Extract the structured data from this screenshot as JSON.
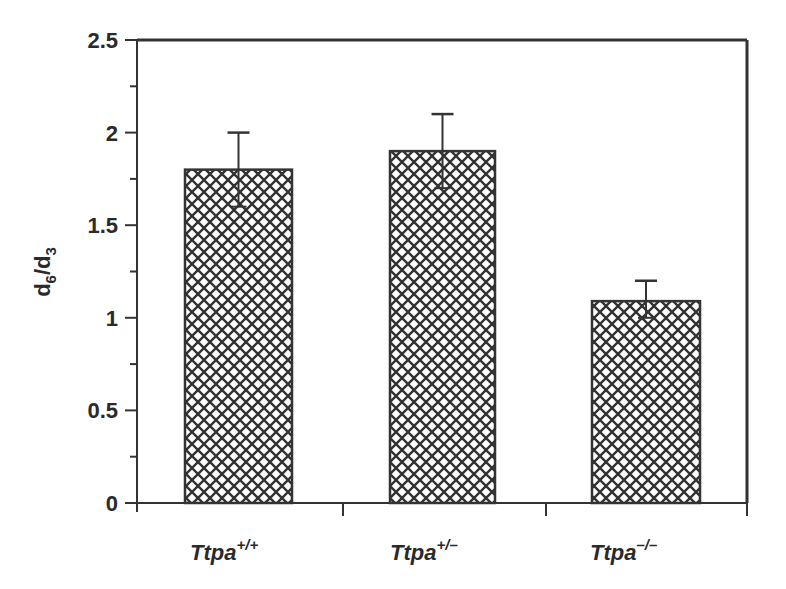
{
  "chart_data": {
    "type": "bar",
    "title": "",
    "xlabel": "",
    "ylabel": "d6/d3",
    "ylabel_parts": {
      "main1": "d",
      "sub1": "6",
      "slash": "/",
      "main2": "d",
      "sub2": "3"
    },
    "ylim": [
      0,
      2.5
    ],
    "yticks": [
      "0",
      "0.5",
      "1",
      "1.5",
      "2",
      "2.5"
    ],
    "categories": [
      "Ttpa+/+",
      "Ttpa+/-",
      "Ttpa-/-"
    ],
    "category_parts": [
      {
        "base": "Ttpa",
        "sup": "+/+"
      },
      {
        "base": "Ttpa",
        "sup": "+/–"
      },
      {
        "base": "Ttpa",
        "sup": "–/–"
      }
    ],
    "values": [
      1.8,
      1.9,
      1.09
    ],
    "error_upper": [
      0.2,
      0.2,
      0.11
    ],
    "error_lower": [
      0.2,
      0.2,
      0.09
    ],
    "bar_fill": "crosshatch",
    "grid": false,
    "legend": null
  }
}
